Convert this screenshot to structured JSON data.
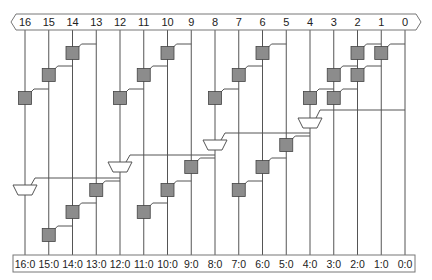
{
  "diagram": {
    "inputs": [
      "16",
      "15",
      "14",
      "13",
      "12",
      "11",
      "10",
      "9",
      "8",
      "7",
      "6",
      "5",
      "4",
      "3",
      "2",
      "1",
      "0"
    ],
    "outputs": [
      "16:0",
      "15:0",
      "14:0",
      "13:0",
      "12:0",
      "11:0",
      "10:0",
      "9:0",
      "8:0",
      "7:0",
      "6:0",
      "5:0",
      "4:0",
      "3:0",
      "2:0",
      "1:0",
      "0:0"
    ],
    "colors": {
      "line": "#555555",
      "box_fill": "#8c8c8c",
      "box_stroke": "#444444",
      "mux_fill": "#ffffff",
      "frame_stroke": "#777777"
    },
    "cells": [
      {
        "col": 14,
        "row": 0,
        "from": 13
      },
      {
        "col": 15,
        "row": 1,
        "from": 14
      },
      {
        "col": 16,
        "row": 2,
        "from": 15
      },
      {
        "col": 10,
        "row": 0,
        "from": 9
      },
      {
        "col": 11,
        "row": 1,
        "from": 10
      },
      {
        "col": 12,
        "row": 2,
        "from": 11
      },
      {
        "col": 6,
        "row": 0,
        "from": 5
      },
      {
        "col": 7,
        "row": 1,
        "from": 6
      },
      {
        "col": 8,
        "row": 2,
        "from": 7
      },
      {
        "col": 2,
        "row": 0,
        "from": 1
      },
      {
        "col": 1,
        "row": 0,
        "from": 0
      },
      {
        "col": 3,
        "row": 1,
        "from": 2
      },
      {
        "col": 2,
        "row": 1,
        "from": 1
      },
      {
        "col": 4,
        "row": 2,
        "from": 3
      },
      {
        "col": 3,
        "row": 2,
        "from": 2
      }
    ],
    "muxes": [
      {
        "col": 4,
        "y": 118,
        "sel_from": 0,
        "sel_y": 110
      },
      {
        "col": 8,
        "y": 140,
        "sel_from": 4,
        "sel_y": 133
      },
      {
        "col": 12,
        "y": 162,
        "sel_from": 8,
        "sel_y": 155
      },
      {
        "col": 16,
        "y": 185,
        "sel_from": 12,
        "sel_y": 178
      }
    ],
    "lower_cells": [
      {
        "col": 5,
        "y": 145,
        "from": 4
      },
      {
        "col": 6,
        "y": 167,
        "from": 5
      },
      {
        "col": 7,
        "y": 190,
        "from": 6
      },
      {
        "col": 9,
        "y": 167,
        "from": 8
      },
      {
        "col": 10,
        "y": 190,
        "from": 9
      },
      {
        "col": 11,
        "y": 212,
        "from": 10
      },
      {
        "col": 13,
        "y": 190,
        "from": 12
      },
      {
        "col": 14,
        "y": 212,
        "from": 13
      },
      {
        "col": 15,
        "y": 235,
        "from": 14
      }
    ]
  }
}
